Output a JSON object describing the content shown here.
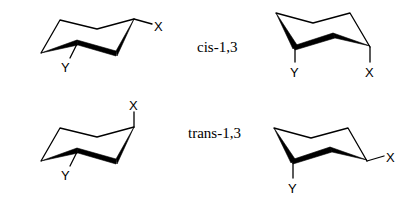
{
  "figure": {
    "rows": [
      {
        "label": "cis-1,3",
        "structures": [
          {
            "id": "cis-chair-a",
            "substituents": {
              "x": "X",
              "y": "Y"
            },
            "x_position": "equatorial",
            "y_position": "axial-down"
          },
          {
            "id": "cis-chair-b",
            "substituents": {
              "x": "X",
              "y": "Y"
            },
            "x_position": "axial-down",
            "y_position": "axial-down"
          }
        ]
      },
      {
        "label": "trans-1,3",
        "structures": [
          {
            "id": "trans-chair-a",
            "substituents": {
              "x": "X",
              "y": "Y"
            },
            "x_position": "axial-up",
            "y_position": "axial-down"
          },
          {
            "id": "trans-chair-b",
            "substituents": {
              "x": "X",
              "y": "Y"
            },
            "x_position": "equatorial",
            "y_position": "axial-down"
          }
        ]
      }
    ]
  },
  "labels": {
    "cis": "cis-1,3",
    "trans": "trans-1,3",
    "x": "X",
    "y": "Y"
  }
}
